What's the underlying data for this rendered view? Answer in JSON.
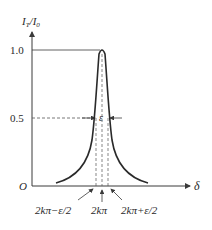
{
  "figure": {
    "y_axis_label": "I",
    "y_axis_label_sub1": "T",
    "y_axis_label_mid": "/I",
    "y_axis_label_sub2": "0",
    "x_axis_label": "δ",
    "origin_label": "O",
    "y_ticks": [
      "1.0",
      "0.5"
    ],
    "width_label": "ε",
    "x_annotations": [
      "2kπ−ε/2",
      "2kπ",
      "2kπ+ε/2"
    ],
    "colors": {
      "curve": "#2a2a2a",
      "axis": "#3a3a3a",
      "dashed": "#555555"
    }
  }
}
